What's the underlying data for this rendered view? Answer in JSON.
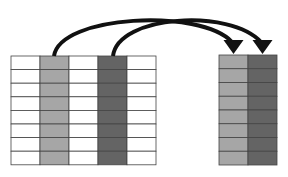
{
  "diagram": {
    "colors": {
      "background": "#ffffff",
      "grid_line": "#444444",
      "empty_cell": "#ffffff",
      "light_column": "#a6a6a6",
      "dark_column": "#646464",
      "arrow": "#111111"
    },
    "source_table": {
      "x": 11,
      "y": 56,
      "col_width": 29,
      "row_height": 13.6,
      "columns": 5,
      "rows": 8,
      "column_fills": [
        "empty",
        "light",
        "empty",
        "dark",
        "empty"
      ]
    },
    "target_table": {
      "x": 219,
      "y": 55,
      "col_width": 29,
      "row_height": 13.75,
      "columns": 2,
      "rows": 8,
      "column_fills": [
        "light",
        "dark"
      ]
    },
    "arrows": [
      {
        "from_column": 1,
        "to_column": 0,
        "path": "M54,56 C60,15 200,8 232,42"
      },
      {
        "from_column": 3,
        "to_column": 1,
        "path": "M113,56 C118,15 230,8 261,42"
      }
    ]
  }
}
